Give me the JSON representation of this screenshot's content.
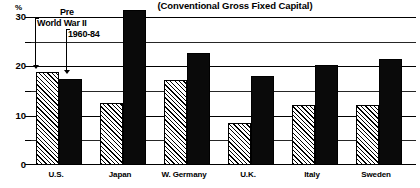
{
  "chart_data": {
    "type": "bar",
    "title": "(Conventional Gross Fixed Capital)",
    "xlabel": "",
    "ylabel": "%",
    "ylim": [
      0,
      30
    ],
    "yticks": [
      0,
      10,
      20,
      30
    ],
    "yticks_minor": [
      5,
      15,
      25
    ],
    "grid": true,
    "legend_position": "inside-top-left",
    "categories": [
      "U.S.",
      "Japan",
      "W. Germany",
      "U.K.",
      "Italy",
      "Sweden"
    ],
    "series": [
      {
        "name": "Pre World War II",
        "pattern": "diagonal-hatch",
        "values": [
          18.8,
          12.5,
          17.3,
          8.5,
          12.2,
          12.2
        ]
      },
      {
        "name": "1960-84",
        "pattern": "solid-black",
        "values": [
          17.5,
          31.5,
          22.8,
          18.0,
          20.3,
          21.5
        ]
      }
    ]
  },
  "axis": {
    "percent_sign": "%",
    "tick_labels": [
      "30",
      "20",
      "10",
      "0"
    ]
  },
  "legend": {
    "label_prewar_line1": "Pre",
    "label_prewar_line2": "World War II",
    "label_postwar": "1960-84"
  },
  "colors": {
    "ink": "#000000",
    "background": "#ffffff",
    "solid_bar": "#0a0a0a"
  }
}
